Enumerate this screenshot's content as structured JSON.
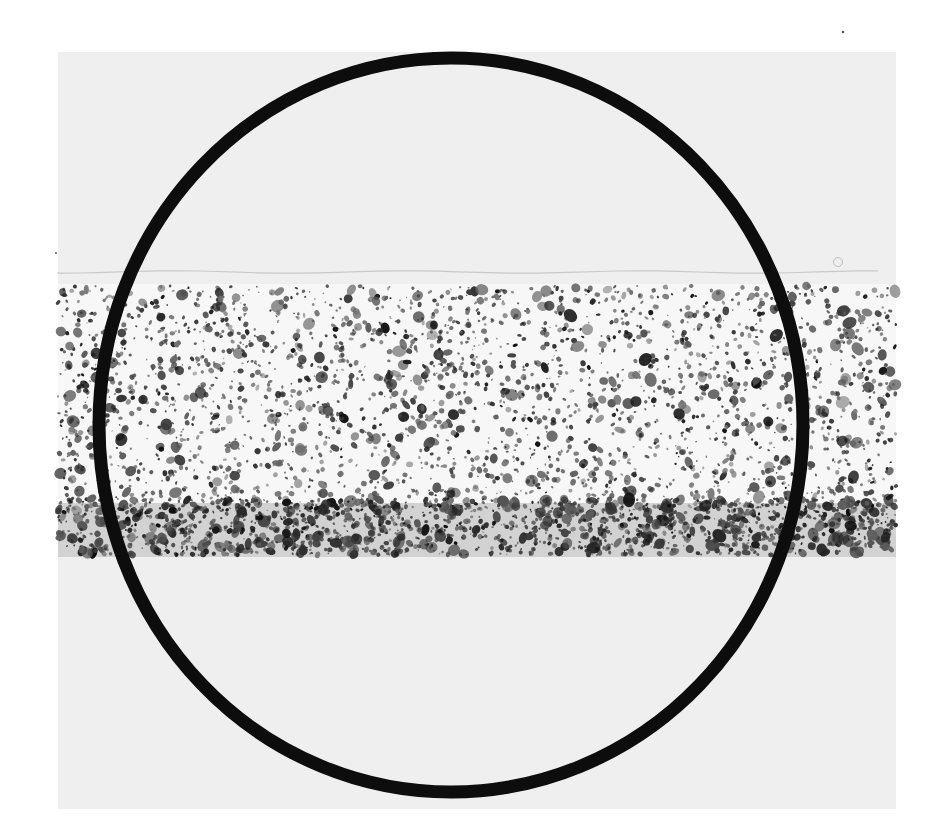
{
  "figure": {
    "type": "micrograph",
    "canvas": {
      "width": 944,
      "height": 835,
      "background": "#ffffff"
    },
    "photo": {
      "x": 58,
      "y": 52,
      "width": 838,
      "height": 757,
      "color": "#efefef"
    },
    "surface_line": {
      "y": 272,
      "color": "#c9c9c9",
      "width": 1.2
    },
    "band": {
      "top": 284,
      "bottom": 557,
      "light_color": "#f7f7f7"
    },
    "dense_layer": {
      "top": 503,
      "bottom": 557,
      "color": "#d2d2d2"
    },
    "particles": {
      "seed": 7,
      "upper_count": 2600,
      "dense_count": 1600
    },
    "overlay_circle": {
      "cx": 451,
      "cy": 425,
      "rx": 352,
      "ry": 367,
      "stroke": "#0d0d0d",
      "stroke_width": 13
    },
    "specks": [
      {
        "x": 843,
        "y": 32,
        "r": 1.3
      },
      {
        "x": 838,
        "y": 262,
        "r": 4.5,
        "ring": true
      },
      {
        "x": 56,
        "y": 253,
        "r": 0.9
      }
    ]
  }
}
